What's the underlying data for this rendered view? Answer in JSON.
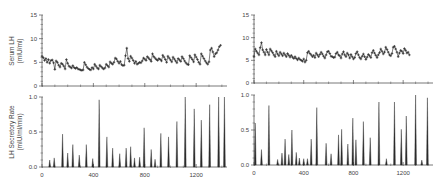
{
  "chart_data": [
    {
      "id": "left-top",
      "type": "scatter",
      "title": "",
      "xlabel": "",
      "ylabel": "Serum LH",
      "ylabel_units": "(mIU/ml)",
      "xlim": [
        0,
        1440
      ],
      "ylim": [
        0,
        15
      ],
      "yticks": [
        0,
        5,
        10,
        15
      ],
      "ytick_labels": [
        "0",
        "5",
        "10",
        "15"
      ],
      "xticks_major": [
        0,
        400,
        800,
        1200
      ],
      "xtick_labels": [],
      "grid": false,
      "marker": "+",
      "series_points": [
        [
          0,
          6.3
        ],
        [
          10,
          6.0
        ],
        [
          20,
          5.4
        ],
        [
          30,
          5.8
        ],
        [
          40,
          5.0
        ],
        [
          50,
          5.6
        ],
        [
          60,
          4.8
        ],
        [
          70,
          5.4
        ],
        [
          80,
          5.5
        ],
        [
          90,
          4.9
        ],
        [
          100,
          3.5
        ],
        [
          110,
          5.3
        ],
        [
          120,
          5.0
        ],
        [
          130,
          4.4
        ],
        [
          140,
          4.0
        ],
        [
          150,
          4.8
        ],
        [
          160,
          4.6
        ],
        [
          170,
          4.2
        ],
        [
          180,
          3.6
        ],
        [
          190,
          5.6
        ],
        [
          200,
          4.8
        ],
        [
          210,
          4.2
        ],
        [
          220,
          4.0
        ],
        [
          230,
          3.8
        ],
        [
          240,
          4.3
        ],
        [
          250,
          3.9
        ],
        [
          260,
          3.7
        ],
        [
          270,
          3.9
        ],
        [
          280,
          3.6
        ],
        [
          290,
          3.5
        ],
        [
          300,
          3.4
        ],
        [
          310,
          3.3
        ],
        [
          320,
          3.4
        ],
        [
          330,
          5.0
        ],
        [
          340,
          4.5
        ],
        [
          350,
          4.0
        ],
        [
          360,
          3.7
        ],
        [
          370,
          3.5
        ],
        [
          380,
          3.4
        ],
        [
          390,
          3.9
        ],
        [
          400,
          3.6
        ],
        [
          410,
          4.6
        ],
        [
          420,
          4.2
        ],
        [
          430,
          3.8
        ],
        [
          440,
          3.6
        ],
        [
          450,
          4.4
        ],
        [
          460,
          4.1
        ],
        [
          470,
          3.8
        ],
        [
          480,
          3.6
        ],
        [
          490,
          3.8
        ],
        [
          500,
          4.6
        ],
        [
          510,
          4.3
        ],
        [
          520,
          4.0
        ],
        [
          530,
          5.1
        ],
        [
          540,
          4.8
        ],
        [
          550,
          4.6
        ],
        [
          560,
          5.0
        ],
        [
          570,
          5.9
        ],
        [
          580,
          5.7
        ],
        [
          590,
          5.2
        ],
        [
          600,
          4.8
        ],
        [
          610,
          5.2
        ],
        [
          620,
          4.5
        ],
        [
          630,
          4.3
        ],
        [
          640,
          4.4
        ],
        [
          650,
          6.4
        ],
        [
          660,
          8.0
        ],
        [
          670,
          5.8
        ],
        [
          680,
          5.2
        ],
        [
          690,
          6.3
        ],
        [
          700,
          5.9
        ],
        [
          710,
          5.4
        ],
        [
          720,
          4.8
        ],
        [
          730,
          5.2
        ],
        [
          740,
          4.6
        ],
        [
          750,
          4.8
        ],
        [
          760,
          5.0
        ],
        [
          770,
          4.9
        ],
        [
          780,
          5.3
        ],
        [
          790,
          5.9
        ],
        [
          800,
          5.7
        ],
        [
          810,
          5.4
        ],
        [
          820,
          6.2
        ],
        [
          830,
          5.9
        ],
        [
          840,
          5.6
        ],
        [
          850,
          5.2
        ],
        [
          860,
          6.8
        ],
        [
          870,
          6.2
        ],
        [
          880,
          5.9
        ],
        [
          890,
          5.6
        ],
        [
          900,
          5.4
        ],
        [
          910,
          5.8
        ],
        [
          920,
          5.6
        ],
        [
          930,
          5.3
        ],
        [
          940,
          6.5
        ],
        [
          950,
          6.1
        ],
        [
          960,
          5.6
        ],
        [
          970,
          5.0
        ],
        [
          980,
          6.3
        ],
        [
          990,
          5.9
        ],
        [
          1000,
          5.5
        ],
        [
          1010,
          5.1
        ],
        [
          1020,
          6.1
        ],
        [
          1030,
          5.7
        ],
        [
          1040,
          5.3
        ],
        [
          1050,
          4.9
        ],
        [
          1060,
          5.8
        ],
        [
          1070,
          5.5
        ],
        [
          1080,
          5.2
        ],
        [
          1090,
          6.2
        ],
        [
          1100,
          5.8
        ],
        [
          1110,
          5.3
        ],
        [
          1120,
          4.9
        ],
        [
          1130,
          4.6
        ],
        [
          1140,
          4.5
        ],
        [
          1150,
          6.4
        ],
        [
          1160,
          6.0
        ],
        [
          1170,
          5.6
        ],
        [
          1180,
          5.1
        ],
        [
          1190,
          6.6
        ],
        [
          1200,
          6.1
        ],
        [
          1210,
          5.6
        ],
        [
          1220,
          5.0
        ],
        [
          1230,
          4.6
        ],
        [
          1240,
          6.8
        ],
        [
          1250,
          6.3
        ],
        [
          1260,
          5.8
        ],
        [
          1270,
          5.3
        ],
        [
          1280,
          4.9
        ],
        [
          1290,
          4.6
        ],
        [
          1300,
          5.1
        ],
        [
          1310,
          7.6
        ],
        [
          1320,
          8.0
        ],
        [
          1330,
          7.2
        ],
        [
          1340,
          6.2
        ],
        [
          1350,
          6.8
        ],
        [
          1360,
          7.0
        ],
        [
          1370,
          7.6
        ],
        [
          1380,
          8.3
        ],
        [
          1390,
          8.6
        ]
      ]
    },
    {
      "id": "left-bottom",
      "type": "bar",
      "title": "",
      "xlabel": "",
      "ylabel": "LH Secretory Rate",
      "ylabel_units": "(mIU/ml/min)",
      "xlim": [
        0,
        1440
      ],
      "ylim": [
        0,
        1.0
      ],
      "yticks": [
        0.0,
        0.5,
        1.0
      ],
      "ytick_labels": [
        "0.0",
        "0.5",
        "1.0"
      ],
      "xticks_major": [
        0,
        400,
        800,
        1200
      ],
      "xtick_labels": [
        "0",
        "400",
        "800",
        "1200"
      ],
      "grid": false,
      "pulses": [
        {
          "x": 60,
          "y": 0.1
        },
        {
          "x": 95,
          "y": 0.13
        },
        {
          "x": 160,
          "y": 0.47
        },
        {
          "x": 200,
          "y": 0.2
        },
        {
          "x": 240,
          "y": 0.32
        },
        {
          "x": 290,
          "y": 0.17
        },
        {
          "x": 345,
          "y": 0.32
        },
        {
          "x": 395,
          "y": 0.12
        },
        {
          "x": 445,
          "y": 0.96
        },
        {
          "x": 505,
          "y": 0.43
        },
        {
          "x": 550,
          "y": 0.27
        },
        {
          "x": 605,
          "y": 0.19
        },
        {
          "x": 655,
          "y": 0.27
        },
        {
          "x": 690,
          "y": 0.29
        },
        {
          "x": 720,
          "y": 0.13
        },
        {
          "x": 760,
          "y": 0.14
        },
        {
          "x": 795,
          "y": 0.56
        },
        {
          "x": 850,
          "y": 0.25
        },
        {
          "x": 880,
          "y": 0.11
        },
        {
          "x": 925,
          "y": 0.48
        },
        {
          "x": 985,
          "y": 0.43
        },
        {
          "x": 1050,
          "y": 0.65
        },
        {
          "x": 1115,
          "y": 1.0
        },
        {
          "x": 1185,
          "y": 0.83
        },
        {
          "x": 1240,
          "y": 0.67
        },
        {
          "x": 1305,
          "y": 0.89
        },
        {
          "x": 1375,
          "y": 1.0
        },
        {
          "x": 1420,
          "y": 1.0
        }
      ]
    },
    {
      "id": "right-top",
      "type": "scatter",
      "title": "",
      "xlabel": "",
      "ylabel": "",
      "xlim": [
        0,
        1440
      ],
      "ylim": [
        0,
        15
      ],
      "yticks": [
        0,
        5,
        10,
        15
      ],
      "ytick_labels": [
        "0",
        "5",
        "10",
        "15"
      ],
      "xticks_major": [
        0,
        400,
        800,
        1200
      ],
      "xtick_labels": [],
      "grid": false,
      "marker": "+",
      "series_points": [
        [
          0,
          5.8
        ],
        [
          10,
          7.5
        ],
        [
          20,
          7.0
        ],
        [
          30,
          6.6
        ],
        [
          40,
          6.2
        ],
        [
          50,
          7.8
        ],
        [
          60,
          8.9
        ],
        [
          70,
          7.3
        ],
        [
          80,
          6.8
        ],
        [
          90,
          6.2
        ],
        [
          100,
          7.4
        ],
        [
          110,
          6.8
        ],
        [
          120,
          6.2
        ],
        [
          130,
          7.5
        ],
        [
          140,
          7.1
        ],
        [
          150,
          6.7
        ],
        [
          160,
          6.2
        ],
        [
          170,
          5.8
        ],
        [
          180,
          7.0
        ],
        [
          190,
          6.4
        ],
        [
          200,
          6.0
        ],
        [
          210,
          6.8
        ],
        [
          220,
          6.4
        ],
        [
          230,
          6.0
        ],
        [
          240,
          6.6
        ],
        [
          250,
          6.2
        ],
        [
          260,
          5.8
        ],
        [
          270,
          6.5
        ],
        [
          280,
          6.1
        ],
        [
          290,
          5.7
        ],
        [
          300,
          6.1
        ],
        [
          310,
          5.7
        ],
        [
          320,
          5.4
        ],
        [
          330,
          5.8
        ],
        [
          340,
          5.4
        ],
        [
          350,
          5.1
        ],
        [
          360,
          5.5
        ],
        [
          370,
          5.2
        ],
        [
          380,
          5.0
        ],
        [
          390,
          4.8
        ],
        [
          400,
          5.3
        ],
        [
          410,
          4.6
        ],
        [
          420,
          5.0
        ],
        [
          430,
          6.7
        ],
        [
          440,
          7.0
        ],
        [
          450,
          6.5
        ],
        [
          460,
          6.2
        ],
        [
          470,
          5.8
        ],
        [
          480,
          6.1
        ],
        [
          490,
          5.6
        ],
        [
          500,
          6.6
        ],
        [
          510,
          6.2
        ],
        [
          520,
          5.8
        ],
        [
          530,
          6.3
        ],
        [
          540,
          6.8
        ],
        [
          550,
          6.4
        ],
        [
          560,
          5.9
        ],
        [
          570,
          5.5
        ],
        [
          580,
          6.2
        ],
        [
          590,
          6.9
        ],
        [
          600,
          7.0
        ],
        [
          610,
          6.5
        ],
        [
          620,
          5.9
        ],
        [
          630,
          5.8
        ],
        [
          640,
          5.6
        ],
        [
          650,
          5.7
        ],
        [
          660,
          6.5
        ],
        [
          670,
          6.8
        ],
        [
          680,
          6.2
        ],
        [
          690,
          6.0
        ],
        [
          700,
          5.5
        ],
        [
          710,
          6.4
        ],
        [
          720,
          6.9
        ],
        [
          730,
          6.2
        ],
        [
          740,
          5.8
        ],
        [
          750,
          6.6
        ],
        [
          760,
          6.2
        ],
        [
          770,
          5.5
        ],
        [
          780,
          6.3
        ],
        [
          790,
          5.8
        ],
        [
          800,
          5.3
        ],
        [
          810,
          5.6
        ],
        [
          820,
          6.5
        ],
        [
          830,
          6.9
        ],
        [
          840,
          6.2
        ],
        [
          850,
          5.6
        ],
        [
          860,
          5.3
        ],
        [
          870,
          5.9
        ],
        [
          880,
          6.4
        ],
        [
          890,
          5.8
        ],
        [
          900,
          5.2
        ],
        [
          910,
          5.7
        ],
        [
          920,
          6.3
        ],
        [
          930,
          6.0
        ],
        [
          940,
          5.6
        ],
        [
          950,
          6.7
        ],
        [
          960,
          7.2
        ],
        [
          970,
          6.6
        ],
        [
          980,
          6.1
        ],
        [
          990,
          5.6
        ],
        [
          1000,
          6.2
        ],
        [
          1010,
          6.7
        ],
        [
          1020,
          7.5
        ],
        [
          1030,
          7.0
        ],
        [
          1040,
          6.4
        ],
        [
          1050,
          6.8
        ],
        [
          1060,
          7.9
        ],
        [
          1070,
          7.4
        ],
        [
          1080,
          6.8
        ],
        [
          1090,
          6.2
        ],
        [
          1100,
          6.0
        ],
        [
          1110,
          6.5
        ],
        [
          1120,
          7.9
        ],
        [
          1130,
          8.1
        ],
        [
          1140,
          7.5
        ],
        [
          1150,
          6.8
        ],
        [
          1160,
          5.8
        ],
        [
          1170,
          6.6
        ],
        [
          1180,
          7.2
        ],
        [
          1190,
          7.0
        ],
        [
          1200,
          6.5
        ],
        [
          1210,
          7.6
        ],
        [
          1220,
          7.2
        ],
        [
          1230,
          6.6
        ],
        [
          1240,
          6.8
        ],
        [
          1250,
          6.2
        ]
      ]
    },
    {
      "id": "right-bottom",
      "type": "bar",
      "title": "",
      "xlabel": "",
      "ylabel": "",
      "xlim": [
        0,
        1440
      ],
      "ylim": [
        0,
        1.0
      ],
      "yticks": [
        0.0,
        0.5,
        1.0
      ],
      "ytick_labels": [
        "0.0",
        "0.5",
        "1.0"
      ],
      "xticks_major": [
        0,
        400,
        800,
        1200
      ],
      "xtick_labels": [
        "0",
        "400",
        "800",
        "1200"
      ],
      "grid": false,
      "pulses": [
        {
          "x": 10,
          "y": 0.6
        },
        {
          "x": 60,
          "y": 0.22
        },
        {
          "x": 120,
          "y": 0.85
        },
        {
          "x": 190,
          "y": 0.08
        },
        {
          "x": 225,
          "y": 0.17
        },
        {
          "x": 250,
          "y": 0.37
        },
        {
          "x": 280,
          "y": 0.15
        },
        {
          "x": 305,
          "y": 0.5
        },
        {
          "x": 340,
          "y": 0.18
        },
        {
          "x": 365,
          "y": 0.1
        },
        {
          "x": 400,
          "y": 0.09
        },
        {
          "x": 430,
          "y": 0.09
        },
        {
          "x": 460,
          "y": 0.37
        },
        {
          "x": 505,
          "y": 0.82
        },
        {
          "x": 580,
          "y": 0.31
        },
        {
          "x": 620,
          "y": 0.16
        },
        {
          "x": 680,
          "y": 0.43
        },
        {
          "x": 705,
          "y": 0.51
        },
        {
          "x": 755,
          "y": 0.3
        },
        {
          "x": 795,
          "y": 0.67
        },
        {
          "x": 820,
          "y": 0.36
        },
        {
          "x": 880,
          "y": 0.62
        },
        {
          "x": 935,
          "y": 0.39
        },
        {
          "x": 1005,
          "y": 0.9
        },
        {
          "x": 1065,
          "y": 0.09
        },
        {
          "x": 1130,
          "y": 0.9
        },
        {
          "x": 1185,
          "y": 0.51
        },
        {
          "x": 1225,
          "y": 0.7
        },
        {
          "x": 1300,
          "y": 1.0
        },
        {
          "x": 1350,
          "y": 0.07
        },
        {
          "x": 1395,
          "y": 0.96
        }
      ]
    }
  ],
  "panels_layout": {
    "left-top": {
      "x0": 42,
      "x1": 227,
      "y0": 86,
      "y1": 15
    },
    "left-bottom": {
      "x0": 42,
      "x1": 227,
      "y0": 167,
      "y1": 97
    },
    "right-top": {
      "x0": 254,
      "y0": 83,
      "x1": 433,
      "y1": 15
    },
    "right-bottom": {
      "x0": 254,
      "y0": 165,
      "x1": 433,
      "y1": 95
    }
  },
  "colors": {
    "ink": "#2a2a2a",
    "axis": "#555555",
    "tick_text": "#444444"
  }
}
